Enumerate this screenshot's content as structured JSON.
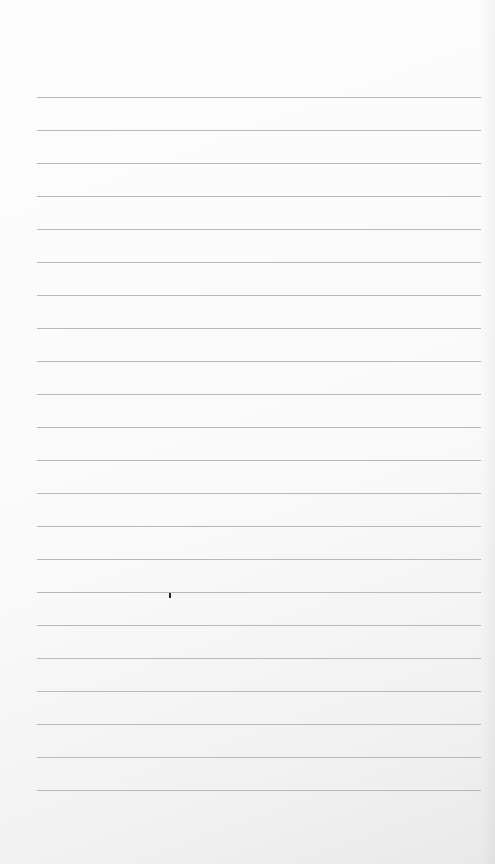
{
  "scene": {
    "description": "Photo of a blank lined notebook paper sheet",
    "paper_color": "#fbfbfb",
    "rule_color": "#b9b9b9",
    "rule_count": 22,
    "rule_start_y": 97,
    "rule_spacing": 33.0,
    "rule_left": 37,
    "rule_right": 481,
    "marks": [
      {
        "type": "pen-dot",
        "x": 169,
        "y": 593
      }
    ]
  }
}
